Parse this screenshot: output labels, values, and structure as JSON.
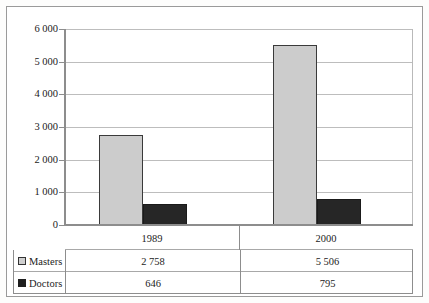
{
  "chart_data": {
    "type": "bar",
    "title": "",
    "subtitle": "",
    "xlabel": "",
    "ylabel": "",
    "categories": [
      "1989",
      "2000"
    ],
    "series": [
      {
        "name": "Masters",
        "values": [
          2758,
          5506
        ],
        "color": "#cccccc",
        "swatch": "light"
      },
      {
        "name": "Doctors",
        "values": [
          646,
          795
        ],
        "color": "#262626",
        "swatch": "dark"
      }
    ],
    "ylim": [
      0,
      6000
    ],
    "ytick_values": [
      6000,
      5000,
      4000,
      3000,
      2000,
      1000,
      0
    ],
    "ytick_labels": [
      "6 000",
      "5 000",
      "4 000",
      "3 000",
      "2 000",
      "1 000",
      "0"
    ],
    "value_labels": [
      {
        "series": "Masters",
        "category": "1989",
        "text": "2 758"
      },
      {
        "series": "Masters",
        "category": "2000",
        "text": "5 506"
      },
      {
        "series": "Doctors",
        "category": "1989",
        "text": "646"
      },
      {
        "series": "Doctors",
        "category": "2000",
        "text": "795"
      }
    ],
    "grid": true,
    "grid_axis": "y",
    "legend": "data-table-below",
    "annotations": []
  },
  "table": {
    "rows": [
      {
        "label": "Masters",
        "swatch": "light",
        "cells": [
          "2 758",
          "5 506"
        ]
      },
      {
        "label": "Doctors",
        "swatch": "dark",
        "cells": [
          "646",
          "795"
        ]
      }
    ]
  }
}
